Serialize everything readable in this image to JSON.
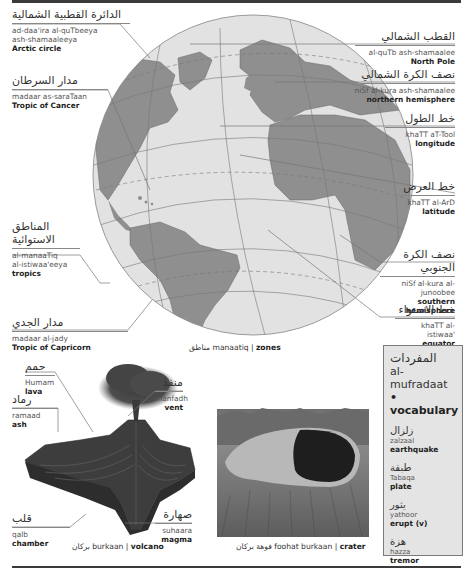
{
  "globe": {
    "caption": {
      "arabic": "مناطق",
      "translit": "manaatiq",
      "english": "zones"
    },
    "labels": {
      "arctic_circle": {
        "arabic": "الدائرة القطبية الشمالية",
        "translit": "ad-daa'ira al-qutbeeya ash-shamaaleeya",
        "translit_1": "ad-daa'ira al-quTbeeya",
        "translit_2": "ash-shamaaleeya",
        "english": "Arctic circle"
      },
      "tropic_of_cancer": {
        "arabic": "مدار السرطان",
        "translit": "madaar as-saraTaan",
        "english": "Tropic of Cancer"
      },
      "tropics": {
        "arabic_1": "المناطق",
        "arabic_2": "الاستوائية",
        "translit_1": "al-manaaTiq",
        "translit_2": "al-istiwaa'eeya",
        "english": "tropics"
      },
      "tropic_of_capricorn": {
        "arabic": "مدار الجدي",
        "translit": "madaar al-jady",
        "english": "Tropic of Capricorn"
      },
      "north_pole": {
        "arabic": "القطب الشمالي",
        "translit": "al-quTb ash-shamaalee",
        "english": "North Pole"
      },
      "northern_hemisphere": {
        "arabic": "نصف الكرة الشمالي",
        "translit": "niSf al-kura ash-shamaalee",
        "english": "northern hemisphere"
      },
      "longitude": {
        "arabic": "خط الطول",
        "translit": "khaTT aT-Tool",
        "english": "longitude"
      },
      "latitude": {
        "arabic": "خط العرض",
        "translit": "khaTT al-ArD",
        "english": "latitude"
      },
      "southern_hemisphere": {
        "arabic": "نصف الكرة الجنوبي",
        "translit": "niSf al-kura al-junoobee",
        "english": "southern hemisphere"
      },
      "equator": {
        "arabic": "خط الاستواء",
        "translit": "khaTT al-istiwaa'",
        "english": "equator"
      }
    }
  },
  "volcano": {
    "caption": {
      "arabic": "بركان",
      "translit": "burkaan",
      "english": "volcano"
    },
    "labels": {
      "lava": {
        "arabic": "حمم",
        "translit": "Humam",
        "english": "lava"
      },
      "ash": {
        "arabic": "رماد",
        "translit": "ramaad",
        "english": "ash"
      },
      "vent": {
        "arabic": "منفذ",
        "translit": "manfadh",
        "english": "vent"
      },
      "chamber": {
        "arabic": "قلب",
        "translit": "qalb",
        "english": "chamber"
      },
      "magma": {
        "arabic": "صهارة",
        "translit": "suhaara",
        "english": "magma"
      }
    }
  },
  "crater": {
    "caption": {
      "arabic": "فوهة بركان",
      "translit": "foohat burkaan",
      "english": "crater"
    }
  },
  "vocabulary": {
    "heading_arabic": "المفردات",
    "heading_translit": "al-mufradaat",
    "heading_english": "• vocabulary",
    "items": [
      {
        "arabic": "زلزال",
        "translit": "zalzaal",
        "english": "earthquake"
      },
      {
        "arabic": "طبقة",
        "translit": "Tabaqa",
        "english": "plate"
      },
      {
        "arabic": "يثور",
        "translit": "yathoor",
        "english": "erupt (v)"
      },
      {
        "arabic": "هزة",
        "translit": "hazza",
        "english": "tremor"
      }
    ]
  },
  "colors": {
    "ocean": "#e2e2e2",
    "land": "#8f8f8f",
    "rule": "#3a3a3a",
    "vocab_bg": "#e4e4e4"
  }
}
